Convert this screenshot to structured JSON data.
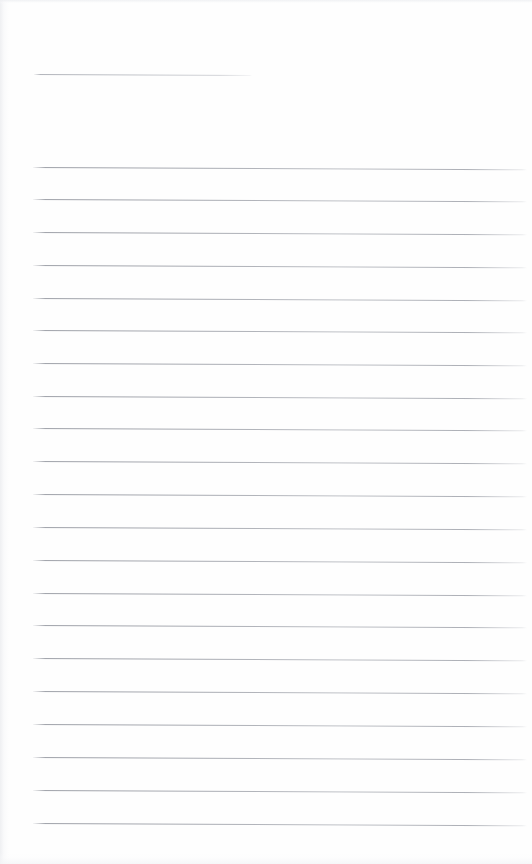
{
  "document": {
    "kind": "scanned-lined-paper",
    "title": "Blank ruled notebook page",
    "page_width": 532,
    "page_height": 864,
    "background_color": "#fefefe",
    "rule_color": "#9a9da5",
    "text_content": "",
    "is_blank": true
  },
  "geometry": {
    "left_margin_x": 33,
    "right_edge_x": 527,
    "rule_thickness_px": 1,
    "rule_spacing_px": 32.6,
    "skew_degrees": 0.26
  },
  "header_rule": {
    "name": "header-rule",
    "x": 34,
    "y": 74,
    "width": 218,
    "note": "short underline near top of page"
  },
  "ruled_lines": [
    {
      "index": 1,
      "x": 33,
      "y": 167,
      "width": 494
    },
    {
      "index": 2,
      "x": 33,
      "y": 199,
      "width": 494
    },
    {
      "index": 3,
      "x": 33,
      "y": 232,
      "width": 494
    },
    {
      "index": 4,
      "x": 33,
      "y": 265,
      "width": 494
    },
    {
      "index": 5,
      "x": 33,
      "y": 298,
      "width": 494
    },
    {
      "index": 6,
      "x": 33,
      "y": 330,
      "width": 494
    },
    {
      "index": 7,
      "x": 33,
      "y": 363,
      "width": 494
    },
    {
      "index": 8,
      "x": 33,
      "y": 396,
      "width": 494
    },
    {
      "index": 9,
      "x": 33,
      "y": 428,
      "width": 494
    },
    {
      "index": 10,
      "x": 33,
      "y": 461,
      "width": 494
    },
    {
      "index": 11,
      "x": 33,
      "y": 494,
      "width": 494
    },
    {
      "index": 12,
      "x": 33,
      "y": 527,
      "width": 494
    },
    {
      "index": 13,
      "x": 33,
      "y": 560,
      "width": 494
    },
    {
      "index": 14,
      "x": 33,
      "y": 593,
      "width": 494
    },
    {
      "index": 15,
      "x": 33,
      "y": 625,
      "width": 494
    },
    {
      "index": 16,
      "x": 33,
      "y": 658,
      "width": 494
    },
    {
      "index": 17,
      "x": 33,
      "y": 691,
      "width": 494
    },
    {
      "index": 18,
      "x": 33,
      "y": 724,
      "width": 494
    },
    {
      "index": 19,
      "x": 33,
      "y": 757,
      "width": 494
    },
    {
      "index": 20,
      "x": 33,
      "y": 790,
      "width": 494
    },
    {
      "index": 21,
      "x": 33,
      "y": 823,
      "width": 494
    }
  ]
}
